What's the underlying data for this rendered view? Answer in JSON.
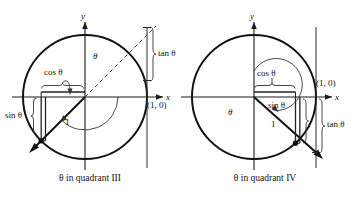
{
  "figure": {
    "background_color": "#ffffff",
    "line_color": "#111111",
    "dash_color": "#444444"
  },
  "panels": [
    {
      "id": "quadrant-iii",
      "caption": "θ in quadrant III",
      "axis_x_label": "x",
      "axis_y_label": "y",
      "point_label": "(1, 0)",
      "labels": {
        "cos": "cos θ",
        "sin": "sin θ",
        "tan": "tan θ",
        "theta": "θ",
        "radius": "1"
      },
      "geometry": {
        "center_x": 85,
        "center_y": 97,
        "radius": 62,
        "terminal_angle_deg": 225,
        "tangent_x": 147
      }
    },
    {
      "id": "quadrant-iv",
      "caption": "θ in quadrant IV",
      "axis_x_label": "x",
      "axis_y_label": "y",
      "point_label": "(1, 0)",
      "labels": {
        "cos": "cos θ",
        "sin": "sin θ",
        "tan": "tan θ",
        "theta": "θ",
        "radius": "1"
      },
      "geometry": {
        "center_x": 254,
        "center_y": 97,
        "radius": 62,
        "terminal_angle_deg": 312,
        "tangent_x": 316
      }
    }
  ]
}
